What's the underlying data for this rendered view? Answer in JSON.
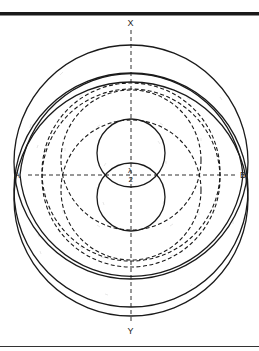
{
  "figure": {
    "labels": {
      "top_axis": "X",
      "bottom_axis": "Y",
      "left_point": "A",
      "right_point": "B",
      "center_numerator": "λ",
      "center_denominator": "2"
    },
    "colors": {
      "ink": "#1a1a1a",
      "background": "#ffffff"
    },
    "elements": {
      "top_rule": "thick-horizontal-rule",
      "bottom_rule": "thin-horizontal-rule",
      "axes": [
        "horizontal-dashed-axis-AB",
        "vertical-dashed-axis-XY"
      ],
      "solid_circles": [
        "outer-upper",
        "outer-lower",
        "middle-upper",
        "middle-lower",
        "small-upper",
        "small-lower"
      ],
      "dashed_circles": [
        "dashed-upper",
        "dashed-lower",
        "dashed-inner-upper",
        "dashed-inner-lower"
      ]
    }
  }
}
